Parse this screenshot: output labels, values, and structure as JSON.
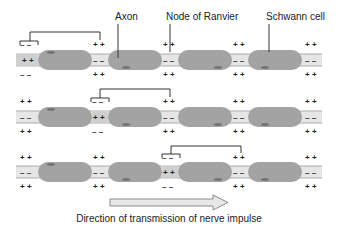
{
  "labels": {
    "axon": "Axon",
    "node": "Node of Ranvier",
    "schwann": "Schwann cell"
  },
  "caption": "Direction of transmission of nerve impulse",
  "colors": {
    "axon_fill": "#e6e6e6",
    "axon_line": "#9a9a9a",
    "schwann_fill": "#a3a3a3",
    "nucleus_fill": "#6e6e6e",
    "depolarized_node": "#cfcfcf",
    "arrow_fill": "#e8e8e8",
    "arrow_stroke": "#8a8a8a"
  },
  "rows": [
    {
      "nodes": [
        {
          "top": "– –",
          "mid": "+ +",
          "bot": "– –",
          "active": true
        },
        {
          "top": "+ +",
          "mid": "– –",
          "bot": "+ +",
          "active": false
        },
        {
          "top": "+ +",
          "mid": "– –",
          "bot": "+ +",
          "active": false
        },
        {
          "top": "+ +",
          "mid": "– –",
          "bot": "+ +",
          "active": false
        },
        {
          "top": "+ +",
          "mid": "– –",
          "bot": "+ +",
          "active": false
        }
      ],
      "current_from": 0,
      "current_to": 1
    },
    {
      "nodes": [
        {
          "top": "+ +",
          "mid": "– –",
          "bot": "+ +",
          "active": false
        },
        {
          "top": "– –",
          "mid": "+ +",
          "bot": "– –",
          "active": true
        },
        {
          "top": "+ +",
          "mid": "– –",
          "bot": "+ +",
          "active": false
        },
        {
          "top": "+ +",
          "mid": "– –",
          "bot": "+ +",
          "active": false
        },
        {
          "top": "+ +",
          "mid": "– –",
          "bot": "+ +",
          "active": false
        }
      ],
      "current_from": 1,
      "current_to": 2
    },
    {
      "nodes": [
        {
          "top": "+ +",
          "mid": "– –",
          "bot": "+ +",
          "active": false
        },
        {
          "top": "+ +",
          "mid": "– –",
          "bot": "+ +",
          "active": false
        },
        {
          "top": "– –",
          "mid": "+ +",
          "bot": "– –",
          "active": true
        },
        {
          "top": "+ +",
          "mid": "– –",
          "bot": "+ +",
          "active": false
        },
        {
          "top": "+ +",
          "mid": "– –",
          "bot": "+ +",
          "active": false
        }
      ],
      "current_from": 2,
      "current_to": 3
    }
  ]
}
